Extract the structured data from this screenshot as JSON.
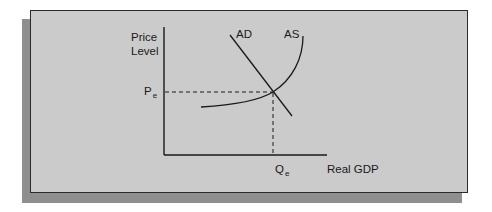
{
  "diagram": {
    "type": "aggregate-demand-aggregate-supply",
    "y_axis_label_line1": "Price",
    "y_axis_label_line2": "Level",
    "x_axis_label": "Real GDP",
    "curves": [
      {
        "name": "AD",
        "label": "AD",
        "shape": "downward-sloping line"
      },
      {
        "name": "AS",
        "label": "AS",
        "shape": "upward-sloping convex curve"
      }
    ],
    "equilibrium": {
      "price_label": "P",
      "price_sub": "e",
      "quantity_label": "Q",
      "quantity_sub": "e"
    },
    "colors": {
      "background": "#cbcbcb",
      "shadow": "#8f8f8f",
      "lines": "#1a1a1a"
    }
  }
}
